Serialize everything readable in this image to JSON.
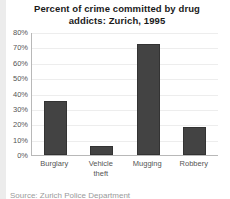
{
  "chart_data": {
    "type": "bar",
    "title": "Percent of crime committed by drug addicts: Zurich, 1995",
    "title_line1": "Percent of crime committed by drug",
    "title_line2": "addicts: Zurich, 1995",
    "categories": [
      "Burglary",
      "Vehicle theft",
      "Mugging",
      "Robbery"
    ],
    "category_lines": [
      [
        "Burglary"
      ],
      [
        "Vehicle",
        "theft"
      ],
      [
        "Mugging"
      ],
      [
        "Robbery"
      ]
    ],
    "values": [
      35,
      6,
      72,
      18
    ],
    "xlabel": "",
    "ylabel": "",
    "ylim": [
      0,
      80
    ],
    "ytick_step": 10,
    "ytick_labels": [
      "80%",
      "70%",
      "60%",
      "50%",
      "40%",
      "30%",
      "20%",
      "10%",
      "0%"
    ],
    "ytick_values": [
      80,
      70,
      60,
      50,
      40,
      30,
      20,
      10,
      0
    ],
    "grid": false,
    "legend": null,
    "bar_color": "#434343",
    "background_color": "#ffffff",
    "axis_color": "#b8b8b8",
    "text_color": "#555555",
    "title_color": "#1a1a1a"
  },
  "footnote": {
    "clipped_text": "Source: Zurich Police Department"
  }
}
